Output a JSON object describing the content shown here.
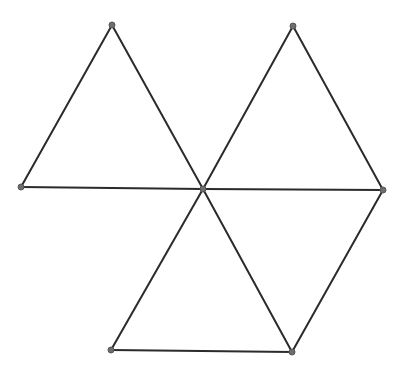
{
  "diagram": {
    "type": "geometric-figure",
    "colors": {
      "background": "#ffffff",
      "edge": "#2b2b2b",
      "vertex": "#6e6e6e"
    },
    "vertices": [
      {
        "id": "L",
        "x": 21,
        "y": 187
      },
      {
        "id": "T1",
        "x": 112,
        "y": 25
      },
      {
        "id": "C",
        "x": 203,
        "y": 189
      },
      {
        "id": "T2",
        "x": 293,
        "y": 26
      },
      {
        "id": "R",
        "x": 383,
        "y": 190
      },
      {
        "id": "BL",
        "x": 111,
        "y": 350
      },
      {
        "id": "BR",
        "x": 292,
        "y": 352
      }
    ],
    "edges": [
      [
        "L",
        "T1"
      ],
      [
        "T1",
        "C"
      ],
      [
        "L",
        "C"
      ],
      [
        "C",
        "T2"
      ],
      [
        "T2",
        "R"
      ],
      [
        "C",
        "R"
      ],
      [
        "C",
        "BR"
      ],
      [
        "R",
        "BR"
      ],
      [
        "C",
        "BL"
      ],
      [
        "BL",
        "BR"
      ]
    ]
  }
}
